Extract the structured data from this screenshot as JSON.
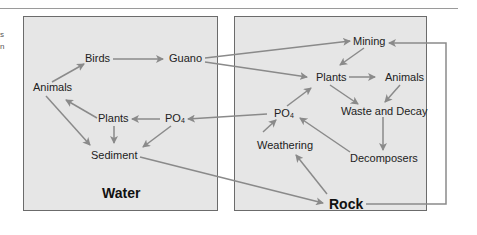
{
  "fragments": [
    "s",
    "n"
  ],
  "water_box": {
    "title": "Water",
    "nodes": {
      "birds": "Birds",
      "guano": "Guano",
      "animals": "Animals",
      "plants": "Plants",
      "po4_base": "PO",
      "po4_sub": "4",
      "sediment": "Sediment"
    }
  },
  "rock_box": {
    "title": "Rock",
    "nodes": {
      "mining": "Mining",
      "plants": "Plants",
      "animals": "Animals",
      "po4_base": "PO",
      "po4_sub": "4",
      "waste": "Waste and Decay",
      "weathering": "Weathering",
      "decomposers": "Decomposers"
    }
  },
  "edges": [
    [
      "Animals",
      "Birds"
    ],
    [
      "Birds",
      "Guano"
    ],
    [
      "Guano",
      "Mining"
    ],
    [
      "Guano",
      "Plants (rock)"
    ],
    [
      "Plants (water)",
      "Animals"
    ],
    [
      "PO4 (water)",
      "Plants (water)"
    ],
    [
      "Plants (water)",
      "Sediment"
    ],
    [
      "Animals",
      "Sediment"
    ],
    [
      "PO4 (water)",
      "Sediment"
    ],
    [
      "PO4 (rock)",
      "PO4 (water)"
    ],
    [
      "Sediment",
      "Rock"
    ],
    [
      "Mining",
      "Plants (rock)"
    ],
    [
      "Plants (rock)",
      "Animals (rock)"
    ],
    [
      "Plants (rock)",
      "Waste and Decay"
    ],
    [
      "Animals (rock)",
      "Waste and Decay"
    ],
    [
      "PO4 (rock)",
      "Plants (rock)"
    ],
    [
      "Waste and Decay",
      "Decomposers"
    ],
    [
      "Decomposers",
      "PO4 (rock)"
    ],
    [
      "Weathering",
      "PO4 (rock)"
    ],
    [
      "Rock",
      "Weathering"
    ],
    [
      "Rock",
      "Mining"
    ]
  ],
  "colors": {
    "box_fill": "#e6e6e6",
    "box_border": "#6b6b6b",
    "arrow": "#8a8a8a",
    "text": "#222222"
  }
}
